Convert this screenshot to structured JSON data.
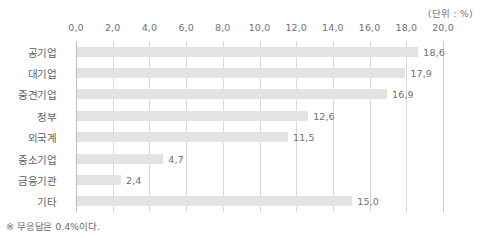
{
  "unit_caption": "(단위 : %)",
  "footnote": "※ 무응답은 0.4%이다.",
  "axis": {
    "tick_labels": [
      "0,0",
      "2,0",
      "4,0",
      "6,0",
      "8,0",
      "10,0",
      "12,0",
      "14,0",
      "16,0",
      "18,0",
      "20,0"
    ]
  },
  "chart_data": {
    "type": "bar",
    "orientation": "horizontal",
    "title": "",
    "subtitle": "",
    "xlabel": "",
    "ylabel": "",
    "unit": "%",
    "unit_caption": "(단위 : %)",
    "categories": [
      "공기업",
      "대기업",
      "중견기업",
      "정부",
      "외국계",
      "중소기업",
      "금융기관",
      "기타"
    ],
    "values": [
      18.6,
      17.9,
      16.9,
      12.6,
      11.5,
      4.7,
      2.4,
      15.0
    ],
    "value_labels": [
      "18,6",
      "17,9",
      "16,9",
      "12,6",
      "11,5",
      "4,7",
      "2,4",
      "15,0"
    ],
    "xlim": [
      0.0,
      20.0
    ],
    "xticks": [
      0.0,
      2.0,
      4.0,
      6.0,
      8.0,
      10.0,
      12.0,
      14.0,
      16.0,
      18.0,
      20.0
    ],
    "xtick_labels": [
      "0,0",
      "2,0",
      "4,0",
      "6,0",
      "8,0",
      "10,0",
      "12,0",
      "14,0",
      "16,0",
      "18,0",
      "20,0"
    ],
    "grid": true,
    "grid_axis": "x",
    "legend": false,
    "bar_color": "#e3e3e3",
    "gridline_color": "#d8d8d8",
    "text_color": "#6f6f6f",
    "annotations": [
      "※ 무응답은 0.4%이다."
    ],
    "no_response_pct": 0.4
  }
}
